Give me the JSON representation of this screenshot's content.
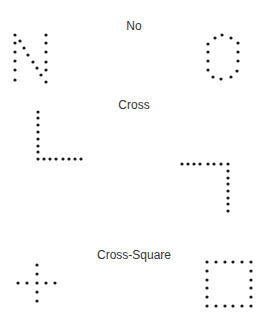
{
  "labels": {
    "no": "No",
    "cross": "Cross",
    "cross_square": "Cross-Square"
  },
  "dot_color": "#1a1a1a",
  "shapes": [
    {
      "name": "letter-n",
      "dots": [
        [
          15,
          35
        ],
        [
          15,
          43
        ],
        [
          15,
          52
        ],
        [
          15,
          61
        ],
        [
          15,
          70
        ],
        [
          15,
          80
        ],
        [
          20,
          41
        ],
        [
          24,
          48
        ],
        [
          28,
          55
        ],
        [
          33,
          62
        ],
        [
          37,
          68
        ],
        [
          41,
          75
        ],
        [
          46,
          35
        ],
        [
          46,
          43
        ],
        [
          46,
          52
        ],
        [
          46,
          62
        ],
        [
          46,
          70
        ],
        [
          46,
          82
        ]
      ]
    },
    {
      "name": "letter-o",
      "dots": [
        [
          208,
          44
        ],
        [
          215,
          38
        ],
        [
          222,
          35
        ],
        [
          231,
          38
        ],
        [
          238,
          43
        ],
        [
          238,
          52
        ],
        [
          238,
          61
        ],
        [
          237,
          71
        ],
        [
          231,
          77
        ],
        [
          221,
          79
        ],
        [
          213,
          77
        ],
        [
          208,
          70
        ],
        [
          208,
          61
        ],
        [
          208,
          52
        ]
      ]
    },
    {
      "name": "corner-l",
      "dots": [
        [
          38,
          112
        ],
        [
          38,
          118
        ],
        [
          38,
          125
        ],
        [
          38,
          132
        ],
        [
          38,
          139
        ],
        [
          38,
          146
        ],
        [
          38,
          152
        ],
        [
          38,
          159
        ],
        [
          44,
          159
        ],
        [
          50,
          159
        ],
        [
          56,
          159
        ],
        [
          63,
          159
        ],
        [
          69,
          159
        ],
        [
          75,
          159
        ],
        [
          81,
          159
        ]
      ]
    },
    {
      "name": "corner-mirrored",
      "dots": [
        [
          182,
          164
        ],
        [
          188,
          164
        ],
        [
          194,
          164
        ],
        [
          200,
          164
        ],
        [
          208,
          164
        ],
        [
          214,
          164
        ],
        [
          221,
          164
        ],
        [
          228,
          164
        ],
        [
          228,
          171
        ],
        [
          228,
          178
        ],
        [
          228,
          184
        ],
        [
          228,
          191
        ],
        [
          228,
          198
        ],
        [
          228,
          204
        ],
        [
          228,
          211
        ]
      ]
    },
    {
      "name": "plus-cross",
      "dots": [
        [
          37,
          265
        ],
        [
          37,
          274
        ],
        [
          37,
          283
        ],
        [
          37,
          292
        ],
        [
          37,
          301
        ],
        [
          18,
          283
        ],
        [
          27,
          283
        ],
        [
          46,
          283
        ],
        [
          55,
          283
        ]
      ]
    },
    {
      "name": "square",
      "dots": [
        [
          207,
          262
        ],
        [
          216,
          262
        ],
        [
          225,
          262
        ],
        [
          233,
          262
        ],
        [
          242,
          262
        ],
        [
          251,
          262
        ],
        [
          251,
          271
        ],
        [
          251,
          280
        ],
        [
          251,
          288
        ],
        [
          251,
          297
        ],
        [
          251,
          306
        ],
        [
          242,
          306
        ],
        [
          233,
          306
        ],
        [
          225,
          306
        ],
        [
          216,
          306
        ],
        [
          207,
          306
        ],
        [
          207,
          297
        ],
        [
          207,
          288
        ],
        [
          207,
          280
        ],
        [
          207,
          271
        ]
      ]
    }
  ]
}
